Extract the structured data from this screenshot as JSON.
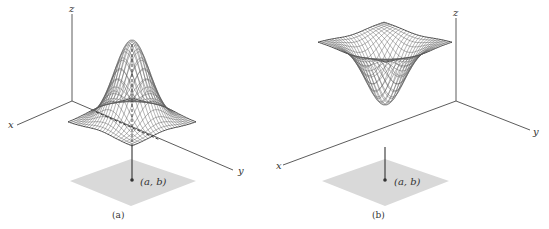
{
  "figure": {
    "panels": [
      {
        "id": "a",
        "caption": "(a)",
        "surface": "local maximum (peak)",
        "axes": {
          "x": "x",
          "y": "y",
          "z": "z"
        },
        "point_label": "(a, b)"
      },
      {
        "id": "b",
        "caption": "(b)",
        "surface": "local minimum (well)",
        "axes": {
          "x": "x",
          "y": "y",
          "z": "z"
        },
        "point_label": "(a, b)"
      }
    ],
    "colors": {
      "axis": "#4a4a4a",
      "mesh": "#5a5a5a",
      "domain_shade": "#d9d9d9",
      "point": "#333333"
    }
  }
}
